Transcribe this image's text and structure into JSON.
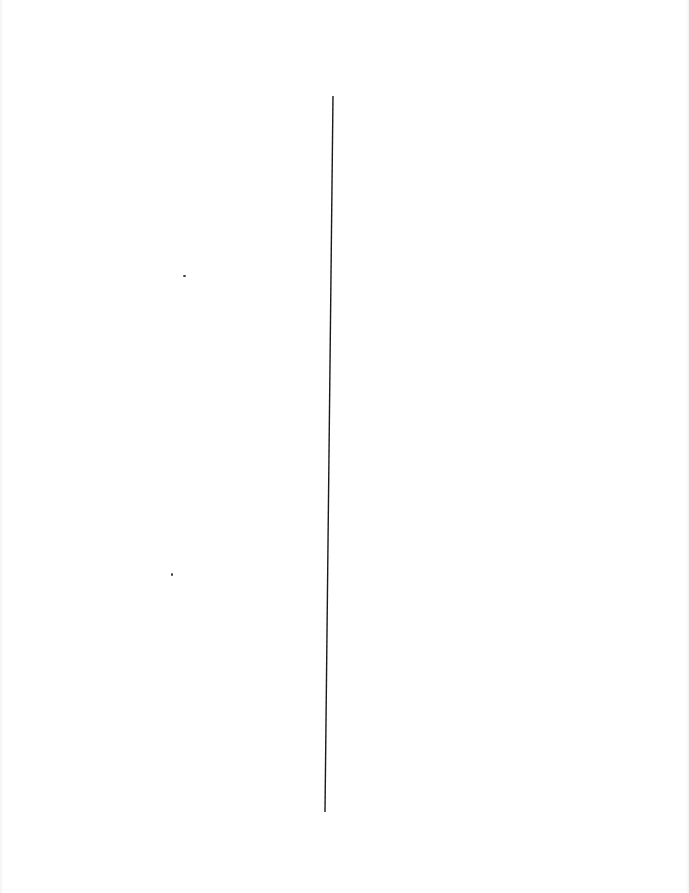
{
  "page": {
    "background": "#ffffff",
    "text": "",
    "divider": {
      "x1": 333,
      "y1": 96,
      "x2": 325,
      "y2": 812,
      "color": "#1a1a1a",
      "width": 1.4
    },
    "specks": [
      {
        "x": 183,
        "y": 275,
        "w": 3,
        "h": 2
      },
      {
        "x": 171,
        "y": 573,
        "w": 2,
        "h": 3
      }
    ]
  }
}
